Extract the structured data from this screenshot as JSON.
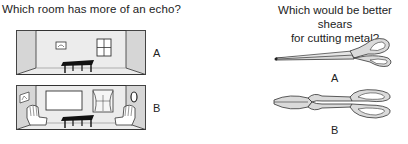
{
  "questions": [
    {
      "text": "Which room has more of an echo?",
      "options": [
        {
          "label": "A",
          "image": "sparse-room-icon",
          "description": "Room with bare walls, small picture, window and table"
        },
        {
          "label": "B",
          "image": "furnished-room-icon",
          "description": "Room with pictures, curtains, mirror, two armchairs and table"
        }
      ]
    },
    {
      "text_line1": "Which would be better shears",
      "text_line2": "for cutting metal?",
      "options": [
        {
          "label": "A",
          "image": "long-blade-scissors-icon"
        },
        {
          "label": "B",
          "image": "short-blade-tin-snips-icon"
        }
      ]
    }
  ],
  "colors": {
    "wall": "#ececec",
    "side_wall": "#d6d6d6",
    "line": "#333333",
    "tool_fill": "#dadada"
  }
}
